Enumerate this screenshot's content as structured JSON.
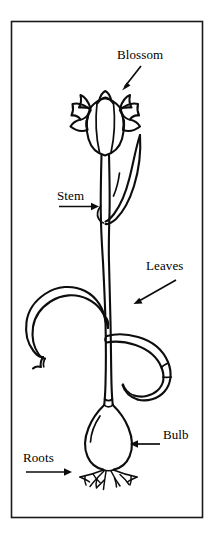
{
  "figure": {
    "kind": "botanical-line-drawing",
    "background_color": "#ffffff",
    "ink_color": "#0d0d0d",
    "frame": {
      "name": "border-frame",
      "stroke_color": "#1a1a1a"
    }
  },
  "labels": {
    "blossom": "Blossom",
    "stem": "Stem",
    "leaves": "Leaves",
    "bulb": "Bulb",
    "roots": "Roots"
  },
  "parts": {
    "blossom": "blossom",
    "upper_leaf": "upper-leaf",
    "stem": "stem",
    "left_leaf": "left-leaf",
    "right_leaf": "right-leaf",
    "bulb": "bulb",
    "roots": "roots"
  },
  "pointers": {
    "blossom": "arrow-down-left",
    "stem": "arrow-right",
    "leaves": "arrow-down-left",
    "bulb": "arrow-left",
    "roots": "arrow-right"
  }
}
